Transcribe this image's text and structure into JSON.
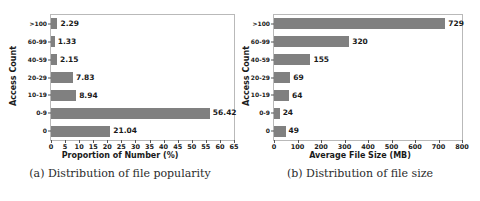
{
  "figure": {
    "panels": [
      {
        "id": "panel-a",
        "caption": "(a) Distribution of file popularity",
        "chart_data": {
          "type": "bar",
          "orientation": "horizontal",
          "title": "",
          "xlabel": "Proportion of Number (%)",
          "ylabel": "Access Count",
          "categories": [
            ">100",
            "60-99",
            "40-59",
            "20-29",
            "10-19",
            "0-9",
            "0"
          ],
          "values": [
            2.29,
            1.33,
            2.15,
            7.83,
            8.94,
            56.42,
            21.04
          ],
          "value_labels": [
            "2.29",
            "1.33",
            "2.15",
            "7.83",
            "8.94",
            "56.42",
            "21.04"
          ],
          "xlim": [
            0,
            65
          ],
          "xticks": [
            0,
            5,
            10,
            15,
            20,
            25,
            30,
            35,
            40,
            45,
            50,
            55,
            60,
            65
          ],
          "xtick_labels": [
            "0",
            "5",
            "10",
            "15",
            "20",
            "25",
            "30",
            "35",
            "40",
            "45",
            "50",
            "55",
            "60",
            "65"
          ],
          "grid": false,
          "legend": false,
          "bar_color": "#808080"
        }
      },
      {
        "id": "panel-b",
        "caption": "(b) Distribution of file size",
        "chart_data": {
          "type": "bar",
          "orientation": "horizontal",
          "title": "",
          "xlabel": "Average File Size (MB)",
          "ylabel": "Access Count",
          "categories": [
            ">100",
            "60-99",
            "40-59",
            "20-29",
            "10-19",
            "0-9",
            "0"
          ],
          "values": [
            729,
            320,
            155,
            69,
            64,
            24,
            49
          ],
          "value_labels": [
            "729",
            "320",
            "155",
            "69",
            "64",
            "24",
            "49"
          ],
          "xlim": [
            0,
            800
          ],
          "xticks": [
            0,
            100,
            200,
            300,
            400,
            500,
            600,
            700,
            800
          ],
          "xtick_labels": [
            "0",
            "100",
            "200",
            "300",
            "400",
            "500",
            "600",
            "700",
            "800"
          ],
          "grid": false,
          "legend": false,
          "bar_color": "#808080"
        }
      }
    ]
  }
}
